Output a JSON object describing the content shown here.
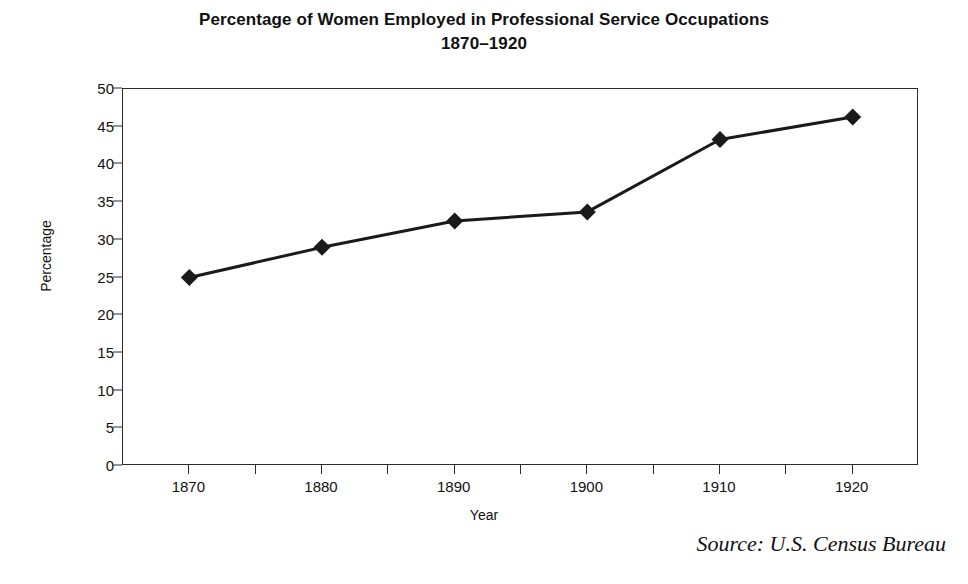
{
  "chart_data": {
    "type": "line",
    "title": "Percentage of Women Employed in Professional Service Occupations",
    "subtitle": "1870–1920",
    "xlabel": "Year",
    "ylabel": "Percentage",
    "source": "Source: U.S. Census Bureau",
    "categories": [
      "1870",
      "1880",
      "1890",
      "1900",
      "1910",
      "1920"
    ],
    "x": [
      1870,
      1880,
      1890,
      1900,
      1910,
      1920
    ],
    "values": [
      25.0,
      29.0,
      32.5,
      33.7,
      43.3,
      46.3
    ],
    "series": [
      {
        "name": "Percentage of Women Employed in Professional Service Occupations",
        "values": [
          25.0,
          29.0,
          32.5,
          33.7,
          43.3,
          46.3
        ]
      }
    ],
    "ylim": [
      0,
      50
    ],
    "ytick_labels": [
      "0",
      "5",
      "10",
      "15",
      "20",
      "25",
      "30",
      "35",
      "40",
      "45",
      "50"
    ],
    "ytick_values": [
      0,
      5,
      10,
      15,
      20,
      25,
      30,
      35,
      40,
      45,
      50
    ],
    "xtick_labels": [
      "1870",
      "1880",
      "1890",
      "1900",
      "1910",
      "1920"
    ],
    "grid": false,
    "legend": "none",
    "marker": "diamond",
    "line_color": "#1a1a1a",
    "marker_color": "#1a1a1a"
  }
}
